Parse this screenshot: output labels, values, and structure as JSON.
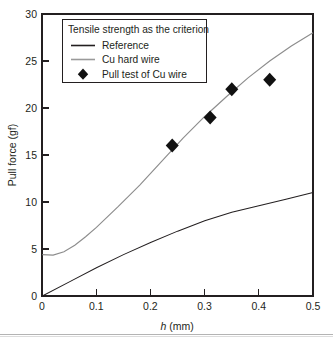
{
  "chart_data": {
    "type": "line",
    "title": "",
    "xlabel": "h (mm)",
    "xlabel_italic_part": "h",
    "xlabel_rest": " (mm)",
    "ylabel": "Pull force (gf)",
    "xlim": [
      0,
      0.5
    ],
    "ylim": [
      0,
      30
    ],
    "xticks": [
      "0",
      "0.1",
      "0.2",
      "0.3",
      "0.4",
      "0.5"
    ],
    "xtick_values": [
      0,
      0.1,
      0.2,
      0.3,
      0.4,
      0.5
    ],
    "yticks": [
      "0",
      "5",
      "10",
      "15",
      "20",
      "25",
      "30"
    ],
    "ytick_values": [
      0,
      5,
      10,
      15,
      20,
      25,
      30
    ],
    "grid": false,
    "legend_position": "top-left",
    "legend_title": "Tensile strength as the criterion",
    "series": [
      {
        "name": "Reference",
        "type": "line",
        "color": "#231f20",
        "x": [
          0,
          0.05,
          0.1,
          0.15,
          0.2,
          0.25,
          0.3,
          0.35,
          0.4,
          0.45,
          0.5
        ],
        "values": [
          0.0,
          1.5,
          3.0,
          4.4,
          5.7,
          6.9,
          8.0,
          8.9,
          9.6,
          10.3,
          11.0
        ]
      },
      {
        "name": "Cu hard wire",
        "type": "line",
        "color": "#8d8d8d",
        "x": [
          0,
          0.02,
          0.04,
          0.06,
          0.08,
          0.1,
          0.14,
          0.18,
          0.22,
          0.26,
          0.3,
          0.34,
          0.38,
          0.42,
          0.46,
          0.5
        ],
        "values": [
          4.4,
          4.35,
          4.7,
          5.4,
          6.3,
          7.3,
          9.5,
          11.8,
          14.3,
          16.8,
          19.1,
          21.2,
          23.2,
          25.0,
          26.6,
          28.0
        ]
      },
      {
        "name": "Pull test of Cu wire",
        "type": "scatter",
        "color": "#111111",
        "marker": "diamond",
        "x": [
          0.24,
          0.31,
          0.35,
          0.42
        ],
        "values": [
          16.0,
          19.0,
          22.0,
          23.0
        ]
      }
    ],
    "legend_entries": [
      {
        "label": "Reference",
        "kind": "line",
        "color": "#231f20"
      },
      {
        "label": "Cu hard wire",
        "kind": "line",
        "color": "#9a9a9a"
      },
      {
        "label": "Pull test of Cu wire",
        "kind": "diamond",
        "color": "#111111"
      }
    ]
  },
  "axis": {
    "y_title": "Pull force (gf)",
    "x_title_italic": "h",
    "x_title_rest": " (mm)",
    "y_tick_labels": [
      "30",
      "25",
      "20",
      "15",
      "10",
      "5",
      "0"
    ],
    "x_tick_labels": [
      "0",
      "0.1",
      "0.2",
      "0.3",
      "0.4",
      "0.5"
    ]
  },
  "legend": {
    "title": "Tensile strength as the criterion",
    "item_reference": "Reference",
    "item_cu_hard_wire": "Cu hard wire",
    "item_pull_test": "Pull test of Cu wire"
  }
}
